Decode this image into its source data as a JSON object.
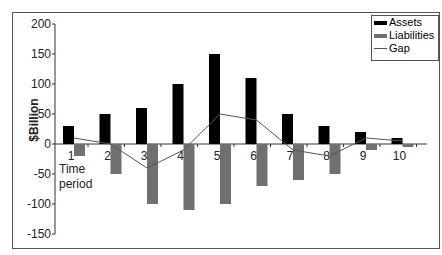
{
  "chart_data": {
    "type": "bar",
    "title": "",
    "xlabel": "Time period",
    "ylabel": "$Billion",
    "ylim": [
      -150,
      200
    ],
    "yticks": [
      200,
      150,
      100,
      50,
      0,
      -50,
      -100,
      -150
    ],
    "categories": [
      "1",
      "2",
      "3",
      "4",
      "5",
      "6",
      "7",
      "8",
      "9",
      "10"
    ],
    "series": [
      {
        "name": "Assets",
        "type": "bar",
        "color": "#000000",
        "values": [
          30,
          50,
          60,
          100,
          150,
          110,
          50,
          30,
          20,
          10
        ]
      },
      {
        "name": "Liabilities",
        "type": "bar",
        "color": "#707070",
        "values": [
          -20,
          -50,
          -100,
          -110,
          -100,
          -70,
          -60,
          -50,
          -10,
          -5
        ]
      },
      {
        "name": "Gap",
        "type": "line",
        "color": "#555555",
        "values": [
          10,
          0,
          -40,
          -10,
          50,
          40,
          -10,
          -20,
          10,
          5
        ]
      }
    ],
    "legend": {
      "position": "top-right",
      "entries": [
        "Assets",
        "Liabilities",
        "Gap"
      ]
    },
    "grid": false
  },
  "labels": {
    "ylabel": "$Billion",
    "xlabel_line1": "Time",
    "xlabel_line2": "period"
  }
}
